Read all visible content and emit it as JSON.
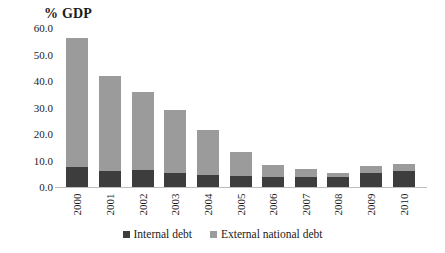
{
  "chart_data": {
    "type": "bar",
    "subtype": "stacked-vertical",
    "title": "% GDP",
    "xlabel": "",
    "ylabel": "% GDP",
    "ylim": [
      0.0,
      60.0
    ],
    "ytick_step": 10.0,
    "ytick_labels": [
      "60.0",
      "50.0",
      "40.0",
      "30.0",
      "20.0",
      "10.0",
      "0.0"
    ],
    "ytick_values": [
      60.0,
      50.0,
      40.0,
      30.0,
      20.0,
      10.0,
      0.0
    ],
    "grid": false,
    "legend_position": "bottom",
    "categories": [
      "2000",
      "2001",
      "2002",
      "2003",
      "2004",
      "2005",
      "2006",
      "2007",
      "2008",
      "2009",
      "2010"
    ],
    "series": [
      {
        "name": "Internal debt",
        "color": "#3d3d3d",
        "values": [
          7.5,
          6.0,
          6.3,
          5.2,
          4.6,
          4.0,
          3.8,
          3.8,
          3.9,
          5.4,
          6.1
        ]
      },
      {
        "name": "External national debt",
        "color": "#9b9b9b",
        "values": [
          48.8,
          36.0,
          29.7,
          23.8,
          16.8,
          9.2,
          4.5,
          2.9,
          1.4,
          2.5,
          2.5
        ]
      }
    ],
    "totals": [
      56.3,
      42.0,
      36.0,
      29.0,
      21.4,
      13.2,
      8.3,
      6.7,
      5.3,
      7.9,
      8.6
    ]
  },
  "legend": {
    "items": [
      {
        "label": "Internal debt",
        "color": "#3d3d3d"
      },
      {
        "label": "External national debt",
        "color": "#9b9b9b"
      }
    ]
  },
  "colors": {
    "internal_debt": "#3d3d3d",
    "external_debt": "#9b9b9b",
    "axis_line": "#bdbdbd",
    "text": "#1a1a1a",
    "background": "#ffffff"
  }
}
